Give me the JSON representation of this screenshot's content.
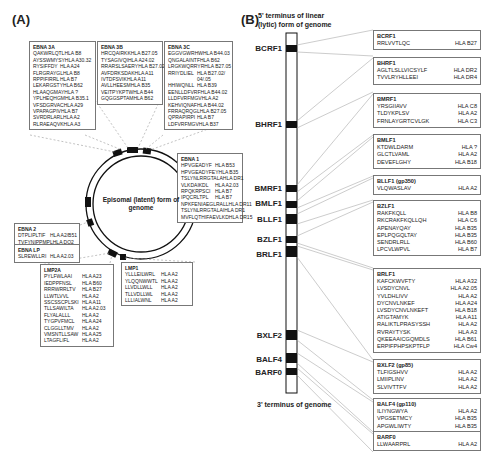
{
  "panel_a": {
    "label": "(A)",
    "circle_caption": "Episomal (latent) form of genome",
    "boxes": [
      {
        "name": "EBNA 3A",
        "rows": [
          [
            "QAKWRLQTL",
            "HLA B8"
          ],
          [
            "AYSSWMYSY",
            "HLA A30.32"
          ],
          [
            "RYSIFFDY",
            "HLA A24"
          ],
          [
            "FLRGRAYGL",
            "HLA B8"
          ],
          [
            "RPPIFIRRL",
            "HLA B7"
          ],
          [
            "LEKARGSTY",
            "HLA B62"
          ],
          [
            "HLAAQGMAY",
            "HLA ?"
          ],
          [
            "YPLHEQHGM",
            "HLA B35.1"
          ],
          [
            "VFSDGRVAC",
            "HLA A29"
          ],
          [
            "VPAPAGPIV",
            "HLA B7"
          ],
          [
            "SVRDRLARL",
            "HLA A2"
          ],
          [
            "RLRAEAQVK",
            "HLA A3"
          ]
        ]
      },
      {
        "name": "EBNA 3B",
        "rows": [
          [
            "HRCQAIRKK",
            "HLA B27.05"
          ],
          [
            "TYSAGIVQI",
            "HLA A24.02"
          ],
          [
            "RRARSLSAERY",
            "HLA B27.02"
          ],
          [
            "AVFDRKSDAK",
            "HLA A11"
          ],
          [
            "IVTDFSVIK",
            "HLA A11"
          ],
          [
            "AVLLHEESM",
            "HLA B35"
          ],
          [
            "VEITPYKPTW",
            "HLA B44"
          ],
          [
            "GQGGSPTAM",
            "HLA B62"
          ]
        ]
      },
      {
        "name": "EBNA 3C",
        "rows": [
          [
            "EGGVGWRHW",
            "HLA B44.03"
          ],
          [
            "QNGALAINTF",
            "HLA B62"
          ],
          [
            "LRGKWQRRYR",
            "HLA B27.05"
          ],
          [
            "RRIYDLIEL",
            "HLA B27.02/"
          ],
          [
            "",
            "04/.05"
          ],
          [
            "HHIWQNLL",
            "HLA B39"
          ],
          [
            "EENLLDFVRF",
            "HLA B44.02"
          ],
          [
            "LLDFVRFMGV",
            "HLA A2"
          ],
          [
            "KEHVIQNAF",
            "HLA B44.02"
          ],
          [
            "FRRAQRQGL",
            "HLA B27.05"
          ],
          [
            "QPRAPIRPI",
            "HLA B7"
          ],
          [
            "LDFVRFMGV",
            "HLA B37"
          ]
        ]
      },
      {
        "name": "EBNA 1",
        "rows": [
          [
            "HPVGEADYF",
            "HLA B53"
          ],
          [
            "HPVGEADYFEY",
            "HLA B35"
          ],
          [
            "TSLYNLRRGTALA",
            "HLA DR1"
          ],
          [
            "VLKDAIKDL",
            "HLA A2.03"
          ],
          [
            "RPQKRPSCI",
            "HLA B7"
          ],
          [
            "IPQCRLTPL",
            "HLA B7"
          ],
          [
            "NPKFENIAEGLRALL",
            "HLA DR11"
          ],
          [
            "TSLYNLRRGTALAI",
            "HLA DR1"
          ],
          [
            "MVFLQTHIFAEVLKD",
            "HLA DR15"
          ]
        ]
      },
      {
        "name": "EBNA 2",
        "rows": [
          [
            "DTPLIPLTIF",
            "HLA A2/B51"
          ],
          [
            "TVFYNIPPMPL",
            "HLA DQ2"
          ]
        ]
      },
      {
        "name": "EBNA LP",
        "rows": [
          [
            "SLREWLLRI",
            "HLA A2.03"
          ]
        ]
      },
      {
        "name": "LMP2A",
        "rows": [
          [
            "PYLFWLAAI",
            "HLA A23"
          ],
          [
            "IEDPPFNSL",
            "HLA B60"
          ],
          [
            "RRRWRRLTV",
            "HLA B27"
          ],
          [
            "LLWTLVVL",
            "HLA A2"
          ],
          [
            "SSCSSCPLSKI",
            "HLA A11"
          ],
          [
            "TLLSAWILTA",
            "HLA A2.03"
          ],
          [
            "FLYALALLL",
            "HLA A2"
          ],
          [
            "TYGPVFMCL",
            "HLA A24"
          ],
          [
            "CLGGLLTMV",
            "HLA A2"
          ],
          [
            "VMSNTLLSAW",
            "HLA A25"
          ],
          [
            "LTAGFLIFL",
            "HLA A2"
          ]
        ]
      },
      {
        "name": "LMP1",
        "rows": [
          [
            "YLLLEILWRL",
            "HLA A2"
          ],
          [
            "YLQQNWWTL",
            "HLA A2"
          ],
          [
            "LLVDLLWLL",
            "HLA A2"
          ],
          [
            "TLLVDLLWL",
            "HLA A2"
          ],
          [
            "LLLIALWNL",
            "HLA A2"
          ]
        ]
      }
    ]
  },
  "panel_b": {
    "label": "(B)",
    "top_caption_line1": "5' terminus of linear",
    "top_caption_line2": "(lytic) form of genome",
    "bottom_caption": "3' terminus of genome",
    "gene_labels": [
      "BCRF1",
      "BHRF1",
      "BMRF1",
      "BMLF1",
      "BLLF1",
      "BZLF1",
      "BRLF1",
      "BXLF2",
      "BALF4",
      "BARF0"
    ],
    "boxes": [
      {
        "name": "BCRF1",
        "rows": [
          [
            "RRLVVTLQC",
            "HLA B27"
          ]
        ]
      },
      {
        "name": "BHRF1",
        "rows": [
          [
            "AGLTLSLLVICSYLF",
            "HLA DR2"
          ],
          [
            "TVVLRYHLLEEI",
            "HLA DR4"
          ]
        ]
      },
      {
        "name": "BMRF1",
        "rows": [
          [
            "YRSGIIAVV",
            "HLA C8"
          ],
          [
            "TLDYKPLSV",
            "HLA A2"
          ],
          [
            "FRNLAYGRTCVLGK",
            "HLA C3"
          ]
        ]
      },
      {
        "name": "BMLF1",
        "rows": [
          [
            "KTDWLDARM",
            "HLA ?"
          ],
          [
            "GLCTLVAML",
            "HLA A2"
          ],
          [
            "DEVEFLGHY",
            "HLA B18"
          ]
        ]
      },
      {
        "name": "BLLF1 (gp350)",
        "rows": [
          [
            "VLQWASLAV",
            "HLA A2"
          ]
        ]
      },
      {
        "name": "BZLF1",
        "rows": [
          [
            "RAKFKQLL",
            "HLA B8"
          ],
          [
            "RKCRAKFKQLLQH",
            "HLA C6"
          ],
          [
            "APENAYQAY",
            "HLA B35"
          ],
          [
            "EPLPQGQLTAY",
            "HLA B35"
          ],
          [
            "SENDRLRLL",
            "HLA B60"
          ],
          [
            "LPCVLWPVL",
            "HLA B7"
          ]
        ]
      },
      {
        "name": "BRLF1",
        "rows": [
          [
            "KAFCKWVFTY",
            "HLA A32"
          ],
          [
            "LVSDYCNVL",
            "HLA A2.05"
          ],
          [
            "YVLDHLIVV",
            "HLA A2"
          ],
          [
            "DYCNVLNKEF",
            "HLA A24"
          ],
          [
            "LVSDYCNVLNKEFT",
            "HLA B18"
          ],
          [
            "ATIGTAMYK",
            "HLA A11"
          ],
          [
            "RALIKTLPRASYSSH",
            "HLA A2"
          ],
          [
            "RVRAYTYSK",
            "HLA A3"
          ],
          [
            "QKEEAAICGQMDLS",
            "HLA B61"
          ],
          [
            "ERPIFPHPSKPTFLP",
            "HLA Cw4"
          ]
        ]
      },
      {
        "name": "BXLF2 (gp85)",
        "rows": [
          [
            "TLFIGSHVV",
            "HLA A2"
          ],
          [
            "LMIIPLINV",
            "HLA A2"
          ],
          [
            "SLVIVTTFV",
            "HLA A2"
          ]
        ]
      },
      {
        "name": "BALF4 (gp110)",
        "rows": [
          [
            "ILIYNGWYA",
            "HLA A2"
          ],
          [
            "VPGSETMCY",
            "HLA B35"
          ],
          [
            "APGWLIWTY",
            "HLA B35"
          ]
        ]
      },
      {
        "name": "BARF0",
        "rows": [
          [
            "LLWAARPRL",
            "HLA A2"
          ]
        ]
      }
    ]
  }
}
